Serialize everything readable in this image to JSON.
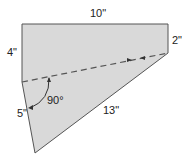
{
  "diagram": {
    "type": "geometry-figure",
    "labels": {
      "top": "10\"",
      "left_upper": "4\"",
      "right": "2\"",
      "left_lower": "5\"",
      "hypotenuse": "13\"",
      "angle": "90°"
    },
    "colors": {
      "fill": "#d9d9d9",
      "stroke": "#555555",
      "dash": "#555555"
    }
  }
}
